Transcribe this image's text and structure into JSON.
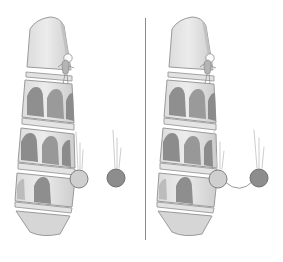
{
  "figure": {
    "background_color": "#ffffff",
    "panel_count": 2
  },
  "divider": {
    "name": "panel divider",
    "orientation": "vertical",
    "color": "#9e9e9e"
  },
  "palette": {
    "tower_light": "#e9e9e9",
    "tower_mid": "#d2d2d2",
    "tower_shadow": "#b9b9b9",
    "arch_dark": "#8e8e8e",
    "arch_mid": "#9c9c9c",
    "outline": "#8a8a8a",
    "ball_light_fill": "#cfcfcf",
    "ball_dark_fill": "#8d8d8d",
    "ball_outline": "#7a7a7a",
    "streak": "#c7c7c7",
    "tether": "#9a9a9a",
    "figure_fill": "#b6b6b6"
  },
  "panels": [
    {
      "id": "left",
      "label": "Separate balls",
      "tower": {
        "name": "leaning tower",
        "lean_direction": "right",
        "tier_count": 3,
        "arches_per_tier": [
          3,
          3,
          2
        ],
        "has_top_cornice": true,
        "has_base": true
      },
      "observer": {
        "name": "person on tower",
        "pose": "standing at tower top releasing balls",
        "head_shape": "circle"
      },
      "balls": [
        {
          "id": "light",
          "label": "light ball",
          "fill": "#cfcfcf",
          "radius_px": 9,
          "cx": 79,
          "cy": 179,
          "streaks": 3
        },
        {
          "id": "heavy",
          "label": "heavy ball",
          "fill": "#8d8d8d",
          "radius_px": 9,
          "cx": 116,
          "cy": 178,
          "streaks": 3
        }
      ],
      "tether": null
    },
    {
      "id": "right",
      "label": "Balls tied together",
      "tower": {
        "name": "leaning tower",
        "lean_direction": "right",
        "tier_count": 3,
        "arches_per_tier": [
          3,
          3,
          2
        ],
        "has_top_cornice": true,
        "has_base": true
      },
      "observer": {
        "name": "person on tower",
        "pose": "standing at tower top releasing balls",
        "head_shape": "circle"
      },
      "balls": [
        {
          "id": "light",
          "label": "light ball",
          "fill": "#cfcfcf",
          "radius_px": 9,
          "cx": 218,
          "cy": 179,
          "streaks": 3
        },
        {
          "id": "heavy",
          "label": "heavy ball",
          "fill": "#8d8d8d",
          "radius_px": 9,
          "cx": 259,
          "cy": 178,
          "streaks": 3
        }
      ],
      "tether": {
        "name": "connecting cord",
        "shape": "sagging curve",
        "color": "#9a9a9a"
      }
    }
  ]
}
